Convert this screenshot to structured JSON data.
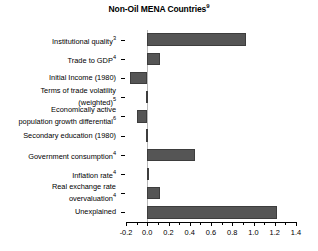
{
  "chart_data": {
    "type": "bar",
    "orientation": "horizontal",
    "title": "Non-Oil MENA Countries",
    "title_superscript": "9",
    "xlabel": "",
    "ylabel": "",
    "xlim": [
      -0.2,
      1.4
    ],
    "xticks": [
      -0.2,
      0.0,
      0.2,
      0.4,
      0.6,
      0.8,
      1.0,
      1.2,
      1.4
    ],
    "xticklabels": [
      "-0.2",
      "0.0",
      "0.2",
      "0.4",
      "0.6",
      "0.8",
      "1.0",
      "1.2",
      "1.4"
    ],
    "minor_ticks": true,
    "grid": false,
    "legend": false,
    "bar_color": "#555555",
    "zero_line_color": "#b9b9b9",
    "categories": [
      "Institutional quality",
      "Trade to GDP",
      "Initial Income (1980)",
      "Terms of trade volatility (weighted)",
      "Economically active population growth differential",
      "Secondary education (1980)",
      "Government consumption",
      "Inflation rate",
      "Real exchange rate overvaluation",
      "Unexplained"
    ],
    "category_labels": [
      {
        "line1": "Institutional quality",
        "line2": "",
        "sup": "3"
      },
      {
        "line1": "Trade to GDP",
        "line2": "",
        "sup": "4"
      },
      {
        "line1": "Initial Income (1980)",
        "line2": "",
        "sup": ""
      },
      {
        "line1": "Terms of trade volatility",
        "line2": "(weighted)",
        "sup": "5"
      },
      {
        "line1": "Economically active",
        "line2": "population growth differential",
        "sup": "6"
      },
      {
        "line1": "Secondary education (1980)",
        "line2": "",
        "sup": ""
      },
      {
        "line1": "Government consumption",
        "line2": "",
        "sup": "4"
      },
      {
        "line1": "Inflation rate",
        "line2": "",
        "sup": "4"
      },
      {
        "line1": "Real exchange rate",
        "line2": "overvaluation",
        "sup": "4"
      },
      {
        "line1": "Unexplained",
        "line2": "",
        "sup": ""
      }
    ],
    "values": [
      0.93,
      0.12,
      -0.16,
      -0.015,
      -0.1,
      -0.012,
      0.45,
      0.005,
      0.12,
      1.22
    ]
  }
}
